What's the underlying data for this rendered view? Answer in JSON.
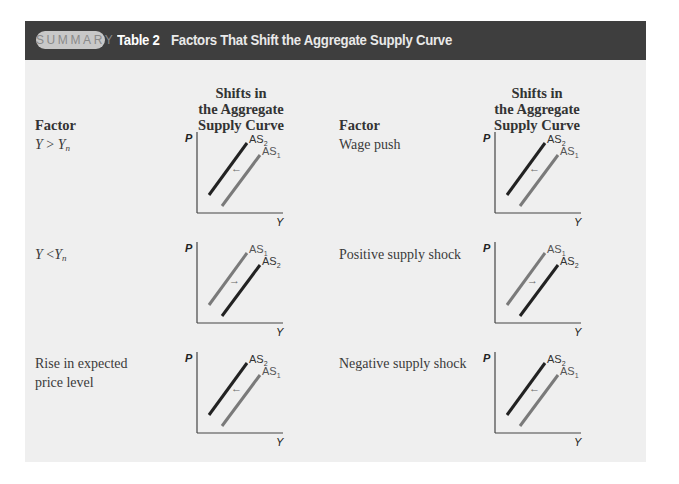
{
  "header": {
    "badge": "SUMMARY",
    "table_number": "Table 2",
    "title": "Factors That Shift the Aggregate Supply Curve"
  },
  "columns": {
    "left_factor": "Factor",
    "left_shift_line1": "Shifts in",
    "left_shift_line2": "the Aggregate",
    "left_shift_line3": "Supply Curve",
    "right_factor": "Factor",
    "right_shift_line1": "Shifts in",
    "right_shift_line2": "the Aggregate",
    "right_shift_line3": "Supply Curve"
  },
  "rows": [
    {
      "factor_base": "Y",
      "factor_op": " > ",
      "factor_rhs": "Y",
      "factor_sub": "n",
      "graph": {
        "y_axis": "P",
        "x_axis": "Y",
        "upper_label": "AS",
        "upper_sub": "2",
        "lower_label": "AS",
        "lower_sub": "1",
        "arrow": "←",
        "direction": "left"
      }
    },
    {
      "factor_base": "Y",
      "factor_op": " <",
      "factor_rhs": "Y",
      "factor_sub": "n",
      "graph": {
        "y_axis": "P",
        "x_axis": "Y",
        "upper_label": "AS",
        "upper_sub": "1",
        "lower_label": "AS",
        "lower_sub": "2",
        "arrow": "→",
        "direction": "right"
      }
    },
    {
      "factor_line1": "Rise in expected",
      "factor_line2": "price level",
      "graph": {
        "y_axis": "P",
        "x_axis": "Y",
        "upper_label": "AS",
        "upper_sub": "2",
        "lower_label": "AS",
        "lower_sub": "1",
        "arrow": "←",
        "direction": "left"
      }
    },
    {
      "factor": "Wage push",
      "graph": {
        "y_axis": "P",
        "x_axis": "Y",
        "upper_label": "AS",
        "upper_sub": "2",
        "lower_label": "AS",
        "lower_sub": "1",
        "arrow": "←",
        "direction": "left"
      }
    },
    {
      "factor": "Positive supply shock",
      "graph": {
        "y_axis": "P",
        "x_axis": "Y",
        "upper_label": "AS",
        "upper_sub": "1",
        "lower_label": "AS",
        "lower_sub": "2",
        "arrow": "→",
        "direction": "right"
      }
    },
    {
      "factor": "Negative supply shock",
      "graph": {
        "y_axis": "P",
        "x_axis": "Y",
        "upper_label": "AS",
        "upper_sub": "2",
        "lower_label": "AS",
        "lower_sub": "1",
        "arrow": "←",
        "direction": "left"
      }
    }
  ],
  "colors": {
    "header_bg": "#3e3e3e",
    "panel_bg": "#efefef",
    "curve_dark": "#222222",
    "curve_gray": "#777777"
  }
}
